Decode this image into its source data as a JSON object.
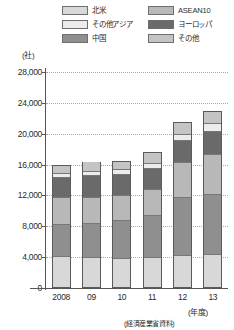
{
  "chart_data": {
    "type": "bar",
    "stacked": true,
    "title": "",
    "xlabel": "(年度)",
    "ylabel": "(社)",
    "categories": [
      "2008",
      "09",
      "10",
      "11",
      "12",
      "13"
    ],
    "ylim": [
      0,
      28000
    ],
    "yticks": [
      0,
      4000,
      8000,
      12000,
      16000,
      20000,
      24000,
      28000
    ],
    "ytick_labels": [
      "0",
      "4,000",
      "8,000",
      "12,000",
      "16,000",
      "20,000",
      "24,000",
      "28,000"
    ],
    "grid": true,
    "legend_position": "top",
    "series": [
      {
        "name": "北米",
        "color": "#d8d8d8",
        "values": [
          3900,
          3800,
          3750,
          3800,
          4050,
          4150
        ]
      },
      {
        "name": "中国",
        "color": "#8f8f8f",
        "values": [
          4300,
          4500,
          4950,
          5500,
          7600,
          7900
        ]
      },
      {
        "name": "ASEAN10",
        "color": "#b8b8b8",
        "values": [
          3500,
          3400,
          3300,
          3450,
          4650,
          5300
        ]
      },
      {
        "name": "ヨーロッパ",
        "color": "#6a6a6a",
        "values": [
          2700,
          2900,
          2750,
          2800,
          2800,
          2950
        ]
      },
      {
        "name": "その他アジア",
        "color": "#ececec",
        "values": [
          450,
          550,
          600,
          700,
          900,
          1050
        ]
      },
      {
        "name": "その他",
        "color": "#c4c4c4",
        "values": [
          1150,
          1250,
          1150,
          1350,
          1500,
          1650
        ]
      }
    ],
    "totals": [
      16000,
      16400,
      16500,
      17600,
      21500,
      23000
    ],
    "source": "(経済産業省資料)"
  },
  "legend": {
    "items": [
      {
        "label": "北米",
        "swatch_color": "#d8d8d8"
      },
      {
        "label": "ASEAN10",
        "swatch_color": "#b8b8b8"
      },
      {
        "label": "その他アジア",
        "swatch_color": "#ececec"
      },
      {
        "label": "ヨーロッパ",
        "swatch_color": "#6a6a6a"
      },
      {
        "label": "中国",
        "swatch_color": "#8f8f8f"
      },
      {
        "label": "その他",
        "swatch_color": "#c4c4c4"
      }
    ]
  },
  "axis": {
    "unit_label": "(社)",
    "x_unit_label": "(年度)"
  },
  "footer": {
    "source": "(経済産業省資料)"
  }
}
